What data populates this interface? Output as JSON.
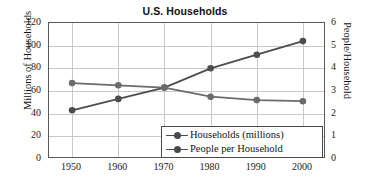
{
  "chart_data": {
    "type": "line",
    "title": "U.S. Households",
    "xlabel": "",
    "ylabel": "Millions of Households",
    "y2label": "People/Household",
    "x": [
      1950,
      1960,
      1970,
      1980,
      1990,
      2000
    ],
    "categories": [
      "1950",
      "1960",
      "1970",
      "1980",
      "1990",
      "2000"
    ],
    "xticks": [
      "1950",
      "1960",
      "1970",
      "1980",
      "1990",
      "2000"
    ],
    "yticks": [
      "0",
      "20",
      "40",
      "60",
      "80",
      "100",
      "120"
    ],
    "y2ticks": [
      "0",
      "1",
      "2",
      "3",
      "4",
      "5",
      "6"
    ],
    "ylim": [
      0,
      120
    ],
    "y2lim": [
      0,
      6
    ],
    "xlim": [
      1945,
      2005
    ],
    "grid": true,
    "legend_position": "bottom-right",
    "series": [
      {
        "name": "Households (millions)",
        "axis": "left",
        "color": "#4d4d4d",
        "marker": "circle",
        "values": [
          43,
          53,
          63,
          80,
          92,
          104
        ]
      },
      {
        "name": "People per Household",
        "axis": "right",
        "color": "#6b6b6b",
        "marker": "circle",
        "values": [
          3.35,
          3.25,
          3.15,
          2.75,
          2.6,
          2.55
        ]
      }
    ]
  },
  "legend": {
    "items": [
      {
        "label": "Households (millions)"
      },
      {
        "label": "People per Household"
      }
    ]
  },
  "colors": {
    "line_primary": "#4d4d4d",
    "line_secondary": "#6b6b6b",
    "grid": "#c9c9c9",
    "frame": "#5a5a5a",
    "text": "#111111",
    "background": "#ffffff"
  }
}
